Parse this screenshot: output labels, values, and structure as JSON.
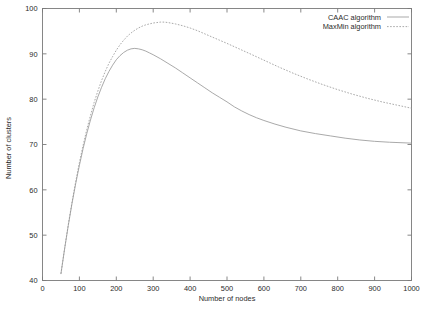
{
  "chart_data": {
    "type": "line",
    "title": "",
    "xlabel": "Number of nodes",
    "ylabel": "Number of clusters",
    "xlim": [
      0,
      1000
    ],
    "ylim": [
      40,
      100
    ],
    "xticks": [
      0,
      100,
      200,
      300,
      400,
      500,
      600,
      700,
      800,
      900,
      1000
    ],
    "yticks": [
      40,
      50,
      60,
      70,
      80,
      90,
      100
    ],
    "xtick_labels": [
      "0",
      "100",
      "200",
      "300",
      "400",
      "500",
      "600",
      "700",
      "800",
      "900",
      "1000"
    ],
    "ytick_labels": [
      "40",
      "50",
      "60",
      "70",
      "80",
      "90",
      "100"
    ],
    "grid": false,
    "legend_position": "top-right-inside",
    "series": [
      {
        "name": "CAAC algorithm",
        "style": "solid",
        "color": "#9a9a9a",
        "x": [
          50,
          60,
          70,
          80,
          90,
          100,
          110,
          120,
          130,
          140,
          150,
          160,
          170,
          180,
          190,
          200,
          210,
          220,
          230,
          240,
          250,
          260,
          270,
          280,
          290,
          300,
          320,
          340,
          360,
          380,
          400,
          420,
          440,
          460,
          480,
          500,
          520,
          540,
          560,
          580,
          600,
          630,
          660,
          700,
          740,
          780,
          820,
          860,
          900,
          940,
          1000
        ],
        "y": [
          41.5,
          47.0,
          52.2,
          57.0,
          61.4,
          65.4,
          69.1,
          72.4,
          75.4,
          78.1,
          80.5,
          82.6,
          84.5,
          86.1,
          87.5,
          88.7,
          89.6,
          90.3,
          90.8,
          91.1,
          91.2,
          91.1,
          90.9,
          90.6,
          90.2,
          89.8,
          88.9,
          87.9,
          86.9,
          85.8,
          84.7,
          83.6,
          82.5,
          81.4,
          80.4,
          79.4,
          78.3,
          77.4,
          76.6,
          75.9,
          75.3,
          74.5,
          73.8,
          73.0,
          72.4,
          71.9,
          71.4,
          71.0,
          70.7,
          70.5,
          70.3
        ]
      },
      {
        "name": "MaxMin algorithm",
        "style": "dashed",
        "color": "#9a9a9a",
        "x": [
          50,
          60,
          70,
          80,
          90,
          100,
          110,
          120,
          130,
          140,
          150,
          160,
          170,
          180,
          190,
          200,
          210,
          220,
          230,
          240,
          250,
          260,
          270,
          280,
          290,
          300,
          310,
          320,
          330,
          340,
          360,
          380,
          400,
          420,
          440,
          460,
          480,
          500,
          530,
          560,
          600,
          640,
          680,
          720,
          760,
          800,
          840,
          880,
          920,
          960,
          1000
        ],
        "y": [
          41.5,
          47.1,
          52.4,
          57.3,
          61.8,
          66.0,
          69.8,
          73.3,
          76.4,
          79.3,
          81.8,
          84.1,
          86.1,
          87.9,
          89.4,
          90.8,
          92.0,
          93.0,
          93.9,
          94.6,
          95.2,
          95.7,
          96.1,
          96.4,
          96.6,
          96.8,
          96.9,
          97.0,
          97.0,
          96.9,
          96.6,
          96.2,
          95.7,
          95.1,
          94.4,
          93.7,
          93.0,
          92.3,
          91.2,
          90.1,
          88.6,
          87.1,
          85.7,
          84.4,
          83.2,
          82.1,
          81.1,
          80.2,
          79.4,
          78.7,
          78.0
        ]
      }
    ]
  },
  "legend": {
    "entries": [
      {
        "label": "CAAC algorithm",
        "style": "solid"
      },
      {
        "label": "MaxMin algorithm",
        "style": "dashed"
      }
    ]
  },
  "colors": {
    "axis": "#7a7a7a",
    "text": "#2b2b2b",
    "series": "#9a9a9a",
    "background": "#ffffff"
  }
}
